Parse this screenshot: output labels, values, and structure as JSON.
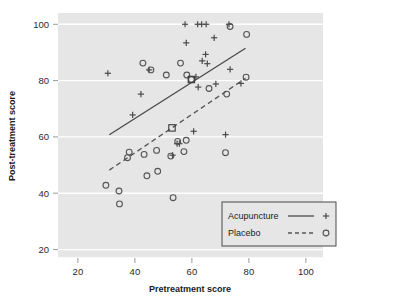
{
  "chart_data": {
    "type": "scatter",
    "title": "",
    "xlabel": "Pretreatment score",
    "ylabel": "Post-treatment score",
    "xlim": [
      13,
      106
    ],
    "ylim": [
      17,
      104
    ],
    "xticks": [
      20,
      40,
      60,
      80,
      100
    ],
    "yticks": [
      20,
      40,
      60,
      80,
      100
    ],
    "xtick_labels": [
      "20",
      "40",
      "60",
      "80",
      "100"
    ],
    "ytick_labels": [
      "20",
      "40",
      "60",
      "80",
      "100"
    ],
    "grid": "horizontal-white",
    "plot_bgcolor": "#e6e6e6",
    "legend_position": "bottom-right",
    "series": [
      {
        "name": "Acupuncture",
        "marker": "plus",
        "line": "solid",
        "color": "#4a4a4a",
        "points": [
          [
            30.5,
            82.6
          ],
          [
            39.2,
            67.8
          ],
          [
            42.1,
            75.2
          ],
          [
            45.0,
            83.8
          ],
          [
            53.2,
            53.5
          ],
          [
            54.8,
            57.6
          ],
          [
            55.6,
            57.6
          ],
          [
            57.6,
            100.0
          ],
          [
            58.0,
            93.4
          ],
          [
            60.6,
            62.0
          ],
          [
            61.4,
            81.3
          ],
          [
            62.0,
            100.0
          ],
          [
            62.2,
            77.7
          ],
          [
            63.4,
            100.0
          ],
          [
            63.6,
            87.0
          ],
          [
            64.8,
            89.3
          ],
          [
            65.0,
            100.0
          ],
          [
            65.4,
            86.0
          ],
          [
            67.8,
            95.2
          ],
          [
            68.4,
            78.8
          ],
          [
            71.8,
            60.8
          ],
          [
            73.0,
            100.0
          ],
          [
            73.4,
            84.0
          ],
          [
            77.2,
            79.0
          ]
        ],
        "fit_line": [
          [
            31.0,
            60.8
          ],
          [
            78.8,
            91.5
          ]
        ],
        "mean_marker": [
          59.8,
          80.4
        ]
      },
      {
        "name": "Placebo",
        "marker": "circle",
        "line": "dashed",
        "color": "#555555",
        "points": [
          [
            29.8,
            42.8
          ],
          [
            34.4,
            40.8
          ],
          [
            34.6,
            36.2
          ],
          [
            37.4,
            52.6
          ],
          [
            38.0,
            54.6
          ],
          [
            42.8,
            86.2
          ],
          [
            43.2,
            53.8
          ],
          [
            44.2,
            46.2
          ],
          [
            45.6,
            83.8
          ],
          [
            47.6,
            55.2
          ],
          [
            48.0,
            47.8
          ],
          [
            51.0,
            82.0
          ],
          [
            52.6,
            53.2
          ],
          [
            53.4,
            38.4
          ],
          [
            55.0,
            58.4
          ],
          [
            56.0,
            86.2
          ],
          [
            57.2,
            54.8
          ],
          [
            58.0,
            58.8
          ],
          [
            58.2,
            82.0
          ],
          [
            59.8,
            80.4
          ],
          [
            66.0,
            77.2
          ],
          [
            71.8,
            54.4
          ],
          [
            72.2,
            75.2
          ],
          [
            73.4,
            99.2
          ],
          [
            79.0,
            81.2
          ],
          [
            79.2,
            96.4
          ]
        ],
        "fit_line": [
          [
            31.0,
            48.2
          ],
          [
            78.8,
            80.8
          ]
        ],
        "mean_marker": [
          53.0,
          63.2
        ]
      }
    ]
  },
  "legend": {
    "entries": [
      {
        "label": "Acupuncture",
        "line_style": "solid",
        "marker": "+"
      },
      {
        "label": "Placebo",
        "line_style": "dashed",
        "marker": "o"
      }
    ]
  }
}
